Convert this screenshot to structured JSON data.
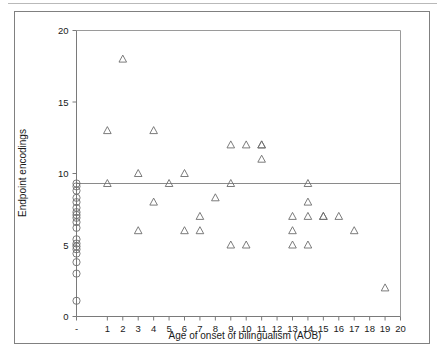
{
  "figure": {
    "background_color": "#ffffff",
    "frame_color": "#808080",
    "marker_color": "#6d6d6d",
    "axis_color": "#7a7a7a"
  },
  "chart_data": {
    "type": "scatter",
    "title": "",
    "xlabel": "Age of onset of bilingualism (AOB)",
    "ylabel": "Endpoint encodings",
    "xlim": [
      -1,
      20
    ],
    "ylim": [
      0,
      20
    ],
    "grid": false,
    "legend": null,
    "xtick_labels": [
      "-",
      "1",
      "2",
      "3",
      "4",
      "5",
      "6",
      "7",
      "8",
      "9",
      "10",
      "11",
      "12",
      "13",
      "14",
      "15",
      "16",
      "17",
      "18",
      "19",
      "20"
    ],
    "xtick_values": [
      -1,
      1,
      2,
      3,
      4,
      5,
      6,
      7,
      8,
      9,
      10,
      11,
      12,
      13,
      14,
      15,
      16,
      17,
      18,
      19,
      20
    ],
    "ytick_labels": [
      "0",
      "5",
      "10",
      "15",
      "20"
    ],
    "ytick_values": [
      0,
      5,
      10,
      15,
      20
    ],
    "annotations": [
      {
        "type": "hline",
        "y": 9.3,
        "label": "reference line"
      }
    ],
    "series": [
      {
        "name": "Native speakers (AOB = -)",
        "marker": "circle",
        "x": [
          -1,
          -1,
          -1,
          -1,
          -1,
          -1,
          -1,
          -1,
          -1,
          -1,
          -1,
          -1,
          -1,
          -1,
          -1,
          -1,
          -1,
          -1,
          -1
        ],
        "y": [
          9.3,
          9.1,
          8.8,
          8.3,
          8.0,
          7.6,
          7.3,
          7.1,
          6.9,
          6.6,
          6.2,
          5.4,
          5.1,
          4.9,
          4.7,
          4.4,
          3.8,
          3.0,
          1.1
        ]
      },
      {
        "name": "Late bilinguals",
        "marker": "triangle",
        "x": [
          1,
          1,
          2,
          3,
          3,
          4,
          4,
          5,
          6,
          6,
          7,
          7,
          8,
          9,
          9,
          9,
          10,
          10,
          11,
          11,
          11,
          13,
          13,
          13,
          14,
          14,
          14,
          14,
          15,
          15,
          16,
          17,
          19
        ],
        "y": [
          13,
          9.3,
          18,
          10,
          6,
          13,
          8,
          9.3,
          10,
          6,
          7,
          6,
          8.3,
          12,
          9.3,
          5,
          12,
          5,
          12,
          12,
          11,
          7,
          6,
          5,
          9.3,
          8,
          7,
          5,
          7,
          7,
          7,
          6,
          2
        ]
      }
    ]
  }
}
